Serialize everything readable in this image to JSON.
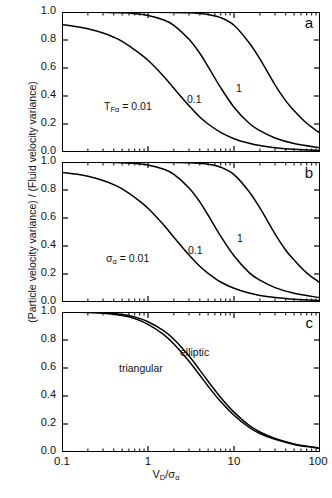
{
  "figure": {
    "ylabel": "(Particle velocity variance) / (Fluid velocity variance)",
    "xlabel_main": "V",
    "xlabel_sub1": "D",
    "xlabel_mid": "/σ",
    "xlabel_sub2": "α"
  },
  "axes": {
    "y_ticks": [
      "0.0",
      "0.2",
      "0.4",
      "0.6",
      "0.8",
      "1.0"
    ],
    "x_ticks": [
      "0.1",
      "1",
      "10",
      "100"
    ]
  },
  "panels": {
    "a": {
      "letter": "a",
      "annotation": "T",
      "annotation_sub": "Fα",
      "annotation_rest": " = 0.01",
      "label_mid": "0.1",
      "label_right": "1"
    },
    "b": {
      "letter": "b",
      "annotation": "σ",
      "annotation_sub": "α",
      "annotation_rest": " = 0.01",
      "label_mid": "0.1",
      "label_right": "1"
    },
    "c": {
      "letter": "c",
      "label_elliptic": "elliptic",
      "label_triangular": "triangular"
    }
  },
  "chart_data": [
    {
      "type": "line",
      "panel": "a",
      "title": "",
      "xlabel": "V_D/σ_α",
      "ylabel": "(Particle velocity variance) / (Fluid velocity variance)",
      "xscale": "log",
      "xlim": [
        0.1,
        100
      ],
      "ylim": [
        0.0,
        1.0
      ],
      "grid": false,
      "legend": "inline-curve-labels",
      "parameter_name": "T_Fα",
      "series": [
        {
          "name": "T_Fα = 0.01",
          "x": [
            0.1,
            0.15,
            0.2,
            0.3,
            0.4,
            0.5,
            0.7,
            1.0,
            1.5,
            2.0,
            3.0,
            4.0,
            5.0,
            7.0,
            10.0,
            15.0,
            20.0,
            30.0,
            50.0,
            100.0
          ],
          "y": [
            0.91,
            0.895,
            0.88,
            0.85,
            0.82,
            0.79,
            0.73,
            0.655,
            0.545,
            0.455,
            0.33,
            0.25,
            0.2,
            0.14,
            0.095,
            0.062,
            0.046,
            0.031,
            0.019,
            0.01
          ]
        },
        {
          "name": "T_Fα = 0.1",
          "x": [
            0.1,
            0.2,
            0.3,
            0.5,
            0.7,
            1.0,
            1.5,
            2.0,
            3.0,
            4.0,
            5.0,
            7.0,
            10.0,
            15.0,
            20.0,
            30.0,
            50.0,
            100.0
          ],
          "y": [
            1.0,
            0.999,
            0.998,
            0.994,
            0.988,
            0.975,
            0.945,
            0.905,
            0.805,
            0.705,
            0.61,
            0.46,
            0.32,
            0.205,
            0.152,
            0.1,
            0.06,
            0.03
          ]
        },
        {
          "name": "T_Fα = 1",
          "x": [
            0.1,
            0.5,
            1.0,
            2.0,
            3.0,
            4.0,
            5.0,
            7.0,
            10.0,
            15.0,
            20.0,
            30.0,
            40.0,
            50.0,
            70.0,
            100.0
          ],
          "y": [
            1.0,
            1.0,
            0.999,
            0.997,
            0.994,
            0.989,
            0.982,
            0.96,
            0.905,
            0.78,
            0.665,
            0.48,
            0.365,
            0.295,
            0.205,
            0.135
          ]
        }
      ]
    },
    {
      "type": "line",
      "panel": "b",
      "title": "",
      "xlabel": "V_D/σ_α",
      "ylabel": "(Particle velocity variance) / (Fluid velocity variance)",
      "xscale": "log",
      "xlim": [
        0.1,
        100
      ],
      "ylim": [
        0.0,
        1.0
      ],
      "grid": false,
      "legend": "inline-curve-labels",
      "parameter_name": "σ_α",
      "series": [
        {
          "name": "σ_α = 0.01",
          "x": [
            0.1,
            0.15,
            0.2,
            0.3,
            0.4,
            0.5,
            0.7,
            1.0,
            1.5,
            2.0,
            3.0,
            4.0,
            5.0,
            7.0,
            10.0,
            15.0,
            20.0,
            30.0,
            50.0,
            100.0
          ],
          "y": [
            0.925,
            0.912,
            0.898,
            0.868,
            0.838,
            0.808,
            0.748,
            0.67,
            0.555,
            0.462,
            0.335,
            0.255,
            0.205,
            0.143,
            0.098,
            0.064,
            0.047,
            0.032,
            0.019,
            0.01
          ]
        },
        {
          "name": "σ_α = 0.1",
          "x": [
            0.1,
            0.2,
            0.3,
            0.5,
            0.7,
            1.0,
            1.5,
            2.0,
            3.0,
            4.0,
            5.0,
            7.0,
            10.0,
            15.0,
            20.0,
            30.0,
            50.0,
            100.0
          ],
          "y": [
            1.0,
            0.999,
            0.998,
            0.995,
            0.99,
            0.978,
            0.95,
            0.912,
            0.815,
            0.715,
            0.62,
            0.47,
            0.33,
            0.21,
            0.156,
            0.103,
            0.062,
            0.031
          ]
        },
        {
          "name": "σ_α = 1",
          "x": [
            0.1,
            0.5,
            1.0,
            2.0,
            3.0,
            4.0,
            5.0,
            7.0,
            10.0,
            15.0,
            20.0,
            30.0,
            40.0,
            50.0,
            70.0,
            100.0
          ],
          "y": [
            1.0,
            1.0,
            0.999,
            0.997,
            0.995,
            0.99,
            0.984,
            0.963,
            0.91,
            0.788,
            0.672,
            0.487,
            0.37,
            0.3,
            0.208,
            0.137
          ]
        }
      ]
    },
    {
      "type": "line",
      "panel": "c",
      "title": "",
      "xlabel": "V_D/σ_α",
      "ylabel": "(Particle velocity variance) / (Fluid velocity variance)",
      "xscale": "log",
      "xlim": [
        0.1,
        100
      ],
      "ylim": [
        0.0,
        1.0
      ],
      "grid": false,
      "legend": "inline-curve-labels",
      "series": [
        {
          "name": "elliptic",
          "x": [
            0.1,
            0.2,
            0.3,
            0.5,
            0.7,
            1.0,
            1.5,
            2.0,
            3.0,
            4.0,
            5.0,
            7.0,
            10.0,
            15.0,
            20.0,
            30.0,
            50.0,
            70.0,
            100.0
          ],
          "y": [
            1.0,
            0.998,
            0.994,
            0.982,
            0.965,
            0.93,
            0.868,
            0.805,
            0.685,
            0.585,
            0.505,
            0.39,
            0.285,
            0.19,
            0.143,
            0.097,
            0.058,
            0.042,
            0.029
          ]
        },
        {
          "name": "triangular",
          "x": [
            0.1,
            0.2,
            0.3,
            0.5,
            0.7,
            1.0,
            1.5,
            2.0,
            3.0,
            4.0,
            5.0,
            7.0,
            10.0,
            15.0,
            20.0,
            30.0,
            50.0,
            70.0,
            100.0
          ],
          "y": [
            1.0,
            0.997,
            0.991,
            0.975,
            0.953,
            0.912,
            0.842,
            0.772,
            0.648,
            0.548,
            0.47,
            0.36,
            0.262,
            0.175,
            0.132,
            0.09,
            0.054,
            0.039,
            0.027
          ]
        }
      ]
    }
  ]
}
